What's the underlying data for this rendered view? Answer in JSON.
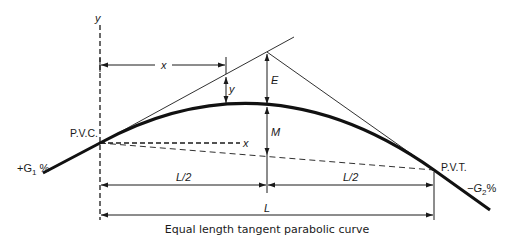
{
  "diagram": {
    "title": "Equal length tangent parabolic curve",
    "caption": "Equal length tangent parabolic curve",
    "labels": {
      "y_axis": "y",
      "x_axis": "x",
      "x_dimension": "x",
      "y_offset": "y",
      "external_distance": "E",
      "middle_ordinate": "M",
      "pvc": "P.V.C.",
      "pvt": "P.V.T.",
      "grade_in": "+G",
      "grade_in_sub": "1",
      "grade_in_unit": " %",
      "grade_out": "−G",
      "grade_out_sub": "2",
      "grade_out_unit": "%",
      "half_length_left": "L/2",
      "half_length_right": "L/2",
      "total_length": "L"
    },
    "elements": [
      "parabolic curve (crest)",
      "back tangent",
      "forward tangent",
      "PVI",
      "long chord (dashed)",
      "horizontal x-axis (dashed)",
      "vertical y-axis (dashed)"
    ],
    "colors": {
      "line": "#1a1a1a",
      "background": "#ffffff"
    }
  }
}
